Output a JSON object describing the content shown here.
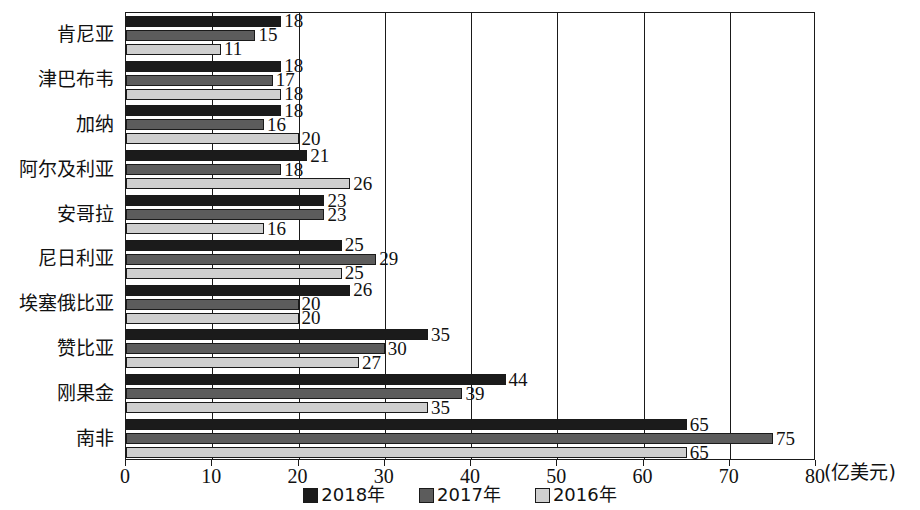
{
  "chart_data": {
    "type": "bar",
    "orientation": "horizontal",
    "title": "",
    "xlabel": "(亿美元)",
    "ylabel": "",
    "xlim": [
      0,
      80
    ],
    "xticks": [
      "0",
      "10",
      "20",
      "30",
      "40",
      "50",
      "60",
      "70",
      "80"
    ],
    "xtick_values": [
      0,
      10,
      20,
      30,
      40,
      50,
      60,
      70,
      80
    ],
    "grid": true,
    "legend_position": "bottom-center",
    "categories": [
      "肯尼亚",
      "津巴布韦",
      "加纳",
      "阿尔及利亚",
      "安哥拉",
      "尼日利亚",
      "埃塞俄比亚",
      "赞比亚",
      "刚果金",
      "南非"
    ],
    "series": [
      {
        "name": "2018年",
        "color": "#1b1b1b",
        "values": [
          18,
          18,
          18,
          21,
          23,
          25,
          26,
          35,
          44,
          65
        ]
      },
      {
        "name": "2017年",
        "color": "#5c5c5c",
        "values": [
          15,
          17,
          16,
          18,
          23,
          29,
          20,
          30,
          39,
          75
        ]
      },
      {
        "name": "2016年",
        "color": "#cfcfcf",
        "values": [
          11,
          18,
          20,
          26,
          16,
          25,
          20,
          27,
          35,
          65
        ]
      }
    ]
  },
  "legend": {
    "items": [
      {
        "label": "2018年",
        "key": "s2018"
      },
      {
        "label": "2017年",
        "key": "s2017"
      },
      {
        "label": "2016年",
        "key": "s2016"
      }
    ]
  }
}
